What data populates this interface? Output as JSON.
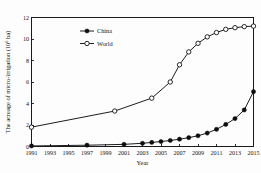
{
  "chart_data": {
    "type": "line",
    "title": "",
    "xlabel": "Year",
    "ylabel": "The acreage of micro-irrigation (10⁶ ha)",
    "xlim": [
      1991,
      2015
    ],
    "ylim": [
      0,
      12
    ],
    "grid": false,
    "legend_position": "top-left-inside",
    "x_ticks": [
      "1991",
      "1993",
      "1995",
      "1997",
      "1999",
      "2001",
      "2003",
      "2005",
      "2007",
      "2009",
      "2011",
      "2013",
      "2015"
    ],
    "y_ticks": [
      "0",
      "2",
      "4",
      "6",
      "8",
      "10",
      "12"
    ],
    "series": [
      {
        "name": "China",
        "marker": "filled-circle",
        "x": [
          1991,
          1997,
          2001,
          2003,
          2004,
          2005,
          2006,
          2007,
          2008,
          2009,
          2010,
          2011,
          2012,
          2013,
          2014,
          2015
        ],
        "values": [
          0.05,
          0.12,
          0.2,
          0.3,
          0.38,
          0.46,
          0.56,
          0.68,
          0.82,
          1.0,
          1.25,
          1.6,
          2.05,
          2.6,
          3.4,
          5.1
        ]
      },
      {
        "name": "World",
        "marker": "open-circle",
        "x": [
          1991,
          2000,
          2004,
          2006,
          2007,
          2008,
          2009,
          2010,
          2011,
          2012,
          2013,
          2014,
          2015
        ],
        "values": [
          1.8,
          3.3,
          4.5,
          6.0,
          7.6,
          8.8,
          9.6,
          10.2,
          10.6,
          10.9,
          11.05,
          11.15,
          11.2
        ]
      }
    ]
  },
  "legend": {
    "entries": [
      {
        "label": "China"
      },
      {
        "label": "World"
      }
    ]
  },
  "colors": {
    "ink": "#111111",
    "background": "#fdfdfd"
  }
}
